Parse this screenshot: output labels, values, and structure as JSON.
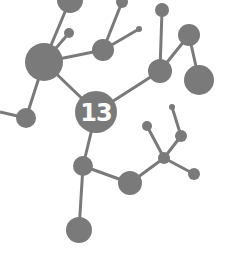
{
  "diagram": {
    "type": "molecule-network",
    "colors": {
      "node": "#7a7a7a",
      "edge": "#7a7a7a",
      "label": "#ffffff",
      "background": "#ffffff"
    },
    "center_label": "13",
    "nodes": [
      {
        "id": "A",
        "x": 70,
        "y": 0,
        "r": 13
      },
      {
        "id": "B",
        "x": 122,
        "y": 2,
        "r": 6
      },
      {
        "id": "C",
        "x": 162,
        "y": 10,
        "r": 7
      },
      {
        "id": "D",
        "x": 69,
        "y": 33,
        "r": 5
      },
      {
        "id": "E",
        "x": 103,
        "y": 50,
        "r": 11
      },
      {
        "id": "F",
        "x": 139,
        "y": 29,
        "r": 3
      },
      {
        "id": "G",
        "x": 44,
        "y": 62,
        "r": 19
      },
      {
        "id": "H",
        "x": 189,
        "y": 35,
        "r": 11
      },
      {
        "id": "I",
        "x": 160,
        "y": 71,
        "r": 12
      },
      {
        "id": "J",
        "x": 199,
        "y": 80,
        "r": 15
      },
      {
        "id": "K",
        "x": 96,
        "y": 112,
        "r": 21,
        "label": "13"
      },
      {
        "id": "L",
        "x": 26,
        "y": 118,
        "r": 10
      },
      {
        "id": "M",
        "x": 83,
        "y": 166,
        "r": 10
      },
      {
        "id": "N",
        "x": 130,
        "y": 183,
        "r": 12
      },
      {
        "id": "O",
        "x": 164,
        "y": 158,
        "r": 6
      },
      {
        "id": "P",
        "x": 147,
        "y": 126,
        "r": 5
      },
      {
        "id": "Q",
        "x": 181,
        "y": 136,
        "r": 6
      },
      {
        "id": "R",
        "x": 172,
        "y": 107,
        "r": 3
      },
      {
        "id": "S",
        "x": 194,
        "y": 174,
        "r": 6
      },
      {
        "id": "T",
        "x": 79,
        "y": 230,
        "r": 13
      }
    ],
    "edges": [
      [
        "A",
        "G"
      ],
      [
        "D",
        "G"
      ],
      [
        "G",
        "E"
      ],
      [
        "B",
        "E"
      ],
      [
        "E",
        "F"
      ],
      [
        "G",
        "L"
      ],
      [
        "G",
        "K"
      ],
      [
        "K",
        "I"
      ],
      [
        "C",
        "I"
      ],
      [
        "I",
        "H"
      ],
      [
        "H",
        "J"
      ],
      [
        "K",
        "M"
      ],
      [
        "M",
        "T"
      ],
      [
        "M",
        "N"
      ],
      [
        "N",
        "O"
      ],
      [
        "O",
        "P"
      ],
      [
        "O",
        "Q"
      ],
      [
        "Q",
        "R"
      ],
      [
        "O",
        "S"
      ]
    ],
    "dangling_edges": [
      {
        "from": "L",
        "to_x": 0,
        "to_y": 112
      }
    ]
  }
}
